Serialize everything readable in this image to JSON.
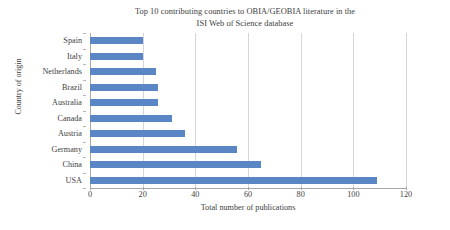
{
  "chart_data": {
    "type": "bar",
    "orientation": "horizontal",
    "title": "Top 10 contributing countries to OBIA/GEOBIA literature in the ISI Web of Science database",
    "title_lines": [
      "Top 10 contributing countries to OBIA/GEOBIA literature in the",
      "ISI Web of Science database"
    ],
    "xlabel": "Total number of publications",
    "ylabel": "Country of origin",
    "categories": [
      "Spain",
      "Italy",
      "Netherlands",
      "Brazil",
      "Australia",
      "Canada",
      "Austria",
      "Germany",
      "China",
      "USA"
    ],
    "values": [
      20,
      20,
      25,
      26,
      26,
      31,
      36,
      56,
      65,
      109
    ],
    "xticks": [
      0,
      20,
      40,
      60,
      80,
      100,
      120
    ],
    "xlim": [
      0,
      120
    ],
    "grid": true,
    "legend": false,
    "bar_color": "#5b86c5",
    "gridline_color": "#d6d6d6",
    "axis_color": "#a8a8a8"
  }
}
